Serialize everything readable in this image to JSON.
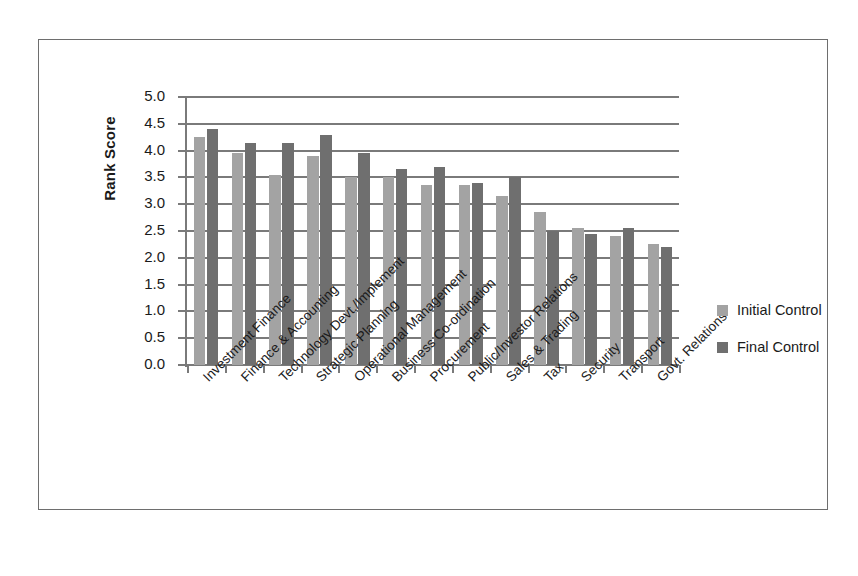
{
  "chart_data": {
    "type": "bar",
    "title": "",
    "xlabel": "",
    "ylabel": "Rank Score",
    "ylim": [
      0.0,
      5.0
    ],
    "ytick_step": 0.5,
    "grid": true,
    "legend_position": "right",
    "ytick_labels": [
      "5.0",
      "4.5",
      "4.0",
      "3.5",
      "3.0",
      "2.5",
      "2.0",
      "1.5",
      "1.0",
      "0.5",
      "0.0"
    ],
    "categories": [
      "Investment Finance",
      "Finance & Accounting",
      "Technology Devt./Implement",
      "Strategic Planning",
      "Operational Management",
      "Business Co-ordination",
      "Procurement",
      "Public/Investor Relations",
      "Sales & Trading",
      "Tax",
      "Security",
      "Transport",
      "Govt. Relations"
    ],
    "series": [
      {
        "name": "Initial Control",
        "color": "#a3a3a3",
        "values": [
          4.25,
          3.95,
          3.55,
          3.9,
          3.5,
          3.5,
          3.35,
          3.35,
          3.15,
          2.85,
          2.55,
          2.4,
          2.25
        ]
      },
      {
        "name": "Final Control",
        "color": "#6f6f6f",
        "values": [
          4.4,
          4.15,
          4.15,
          4.3,
          3.95,
          3.65,
          3.7,
          3.4,
          3.5,
          2.5,
          2.45,
          2.55,
          2.2
        ]
      }
    ]
  },
  "legend": {
    "items": [
      {
        "label": "Initial Control",
        "color": "#a3a3a3"
      },
      {
        "label": "Final Control",
        "color": "#6f6f6f"
      }
    ]
  },
  "colors": {
    "initial_bar": "#a3a3a3",
    "final_bar": "#6f6f6f",
    "grid": "#7a7a7a",
    "frame": "#6e6e6e",
    "text": "#1a1a1a",
    "background": "#ffffff"
  }
}
